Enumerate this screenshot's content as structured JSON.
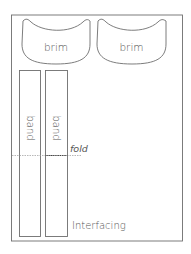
{
  "diagram": {
    "type": "sewing-pattern-layout",
    "colors": {
      "line": "#6e6e6e",
      "text": "#555555",
      "fold_line": "#999999",
      "fold_line_dark": "#444444",
      "background": "#ffffff"
    },
    "fabric": {
      "label": "Interfacing"
    },
    "pieces": [
      {
        "id": "brim-1",
        "label": "brim"
      },
      {
        "id": "brim-2",
        "label": "brim"
      },
      {
        "id": "band-1",
        "label": "band"
      },
      {
        "id": "band-2",
        "label": "band"
      }
    ],
    "fold": {
      "label": "fold"
    }
  }
}
